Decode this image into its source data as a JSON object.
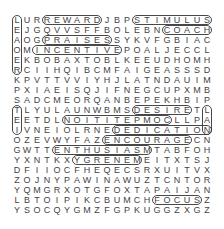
{
  "puzzle": {
    "rows": [
      "LURREWARDJBPSTIMULUS",
      "EJGQVVSFFBOLEBNCOACH",
      "AOGPRAISESSYKVFGBIAC",
      "OMINCENTIVEPOALJECCL",
      "EKBOBAXTOBLKEEUDHOMH",
      "RCIIHQIBCMFAIGEASSSD",
      "KPVTTVVIYHJLATNDAUIM",
      "PXIAEISQJIFNEGCUPXMB",
      "SADCMEORQANBEPEKHBIP",
      "TLYULAUNWBMSDESIRETL",
      "EETDLNOITITEPMOCLLPA",
      "IVNEIOLRNEDEDICATION",
      "OZEVWYFAZENCOURAGECN",
      "GWTTENTHUSIASMTABFOH",
      "YXNTKXYGRENEMEITXTSJ",
      "DFIIOCFHEQECSRXUITVX",
      "ZOJNYPAWINAWUZTCNTOR",
      "YQMGRXOTGFOXTAPAIJAN",
      "LBTOIPIKCBUMCHFOCUSZ",
      "YSOCQYGMZFGPKUGGZXGZ"
    ],
    "found_words": [
      {
        "word": "REWARD",
        "r": 0,
        "c": 3,
        "len": 6,
        "dir": "h"
      },
      {
        "word": "STIMULUS",
        "r": 0,
        "c": 12,
        "len": 8,
        "dir": "h"
      },
      {
        "word": "COACH",
        "r": 1,
        "c": 15,
        "len": 5,
        "dir": "h"
      },
      {
        "word": "PRAISES",
        "r": 2,
        "c": 3,
        "len": 7,
        "dir": "h"
      },
      {
        "word": "INCENTIVE",
        "r": 3,
        "c": 2,
        "len": 9,
        "dir": "h"
      },
      {
        "word": "DESIRE",
        "r": 9,
        "c": 12,
        "len": 6,
        "dir": "h"
      },
      {
        "word": "COMPETITION",
        "r": 10,
        "c": 5,
        "len": 11,
        "dir": "h"
      },
      {
        "word": "DEDICATION",
        "r": 11,
        "c": 10,
        "len": 10,
        "dir": "h"
      },
      {
        "word": "ENCOURAGE",
        "r": 12,
        "c": 9,
        "len": 9,
        "dir": "h"
      },
      {
        "word": "ENTHUSIASM",
        "r": 13,
        "c": 4,
        "len": 10,
        "dir": "h"
      },
      {
        "word": "ENERGY",
        "r": 14,
        "c": 6,
        "len": 7,
        "dir": "h"
      },
      {
        "word": "FOCUS",
        "r": 18,
        "c": 14,
        "len": 5,
        "dir": "h"
      },
      {
        "word": "LEAO",
        "r": 0,
        "c": 0,
        "len": 6,
        "dir": "v"
      },
      {
        "word": "TEAM",
        "r": 9,
        "c": 0,
        "len": 3,
        "dir": "v"
      },
      {
        "word": "TIP",
        "r": 9,
        "c": 19,
        "len": 3,
        "dir": "v"
      }
    ]
  }
}
